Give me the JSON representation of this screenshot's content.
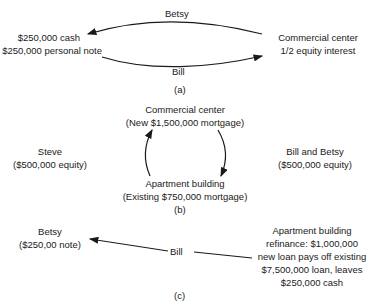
{
  "panel_a": {
    "top_arrow_label": "Betsy",
    "left_line1": "$250,000 cash",
    "left_line2": "$250,000 personal note",
    "right_line1": "Commercial center",
    "right_line2": "1/2 equity interest",
    "bottom_arrow_label": "Bill",
    "caption": "(a)"
  },
  "panel_b": {
    "top_line1": "Commercial center",
    "top_line2": "(New $1,500,000 mortgage)",
    "left_line1": "Steve",
    "left_line2": "($500,000 equity)",
    "right_line1": "Bill and Betsy",
    "right_line2": "($500,000 equity)",
    "bottom_line1": "Apartment building",
    "bottom_line2": "(Existing $750,000 mortgage)",
    "caption": "(b)"
  },
  "panel_c": {
    "left_line1": "Betsy",
    "left_line2": "($250,00 note)",
    "middle": "Bill",
    "right_line1": "Apartment building",
    "right_line2": "refinance:  $1,000,000",
    "right_line3": "new loan pays off existing",
    "right_line4": "$7,500,000 loan, leaves",
    "right_line5": "$250,000 cash",
    "caption": "(c)"
  }
}
